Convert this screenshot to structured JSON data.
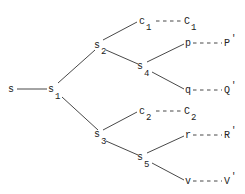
{
  "diagram": {
    "type": "tree",
    "nodes": [
      {
        "id": "s",
        "base": "s",
        "sub": "",
        "x": 8,
        "y": 92
      },
      {
        "id": "s1",
        "base": "s",
        "sub": "1",
        "x": 50,
        "y": 92
      },
      {
        "id": "s2",
        "base": "s",
        "sub": "2",
        "x": 96,
        "y": 48
      },
      {
        "id": "s3",
        "base": "s",
        "sub": "3",
        "x": 96,
        "y": 137
      },
      {
        "id": "c1",
        "base": "c",
        "sub": "1",
        "x": 140,
        "y": 24
      },
      {
        "id": "s4",
        "base": "s",
        "sub": "4",
        "x": 139,
        "y": 69
      },
      {
        "id": "c2",
        "base": "c",
        "sub": "2",
        "x": 140,
        "y": 114
      },
      {
        "id": "s5",
        "base": "s",
        "sub": "5",
        "x": 139,
        "y": 160
      },
      {
        "id": "p",
        "base": "p",
        "sub": "",
        "x": 185,
        "y": 46
      },
      {
        "id": "q",
        "base": "q",
        "sub": "",
        "x": 185,
        "y": 93
      },
      {
        "id": "r",
        "base": "r",
        "sub": "",
        "x": 185,
        "y": 138
      },
      {
        "id": "v",
        "base": "v",
        "sub": "",
        "x": 185,
        "y": 184
      },
      {
        "id": "C1",
        "base": "C",
        "sub": "1",
        "x": 184,
        "y": 24
      },
      {
        "id": "P'",
        "base": "P'",
        "sub": "",
        "x": 224,
        "y": 46
      },
      {
        "id": "Q'",
        "base": "Q'",
        "sub": "",
        "x": 224,
        "y": 93
      },
      {
        "id": "C2",
        "base": "C",
        "sub": "2",
        "x": 184,
        "y": 114
      },
      {
        "id": "R'",
        "base": "R'",
        "sub": "",
        "x": 224,
        "y": 138
      },
      {
        "id": "V'",
        "base": "V'",
        "sub": "",
        "x": 224,
        "y": 184
      }
    ],
    "solid_edges": [
      [
        "s",
        "s1"
      ],
      [
        "s1",
        "s2"
      ],
      [
        "s1",
        "s3"
      ],
      [
        "s2",
        "c1"
      ],
      [
        "s2",
        "s4"
      ],
      [
        "s4",
        "p"
      ],
      [
        "s4",
        "q"
      ],
      [
        "s3",
        "c2"
      ],
      [
        "s3",
        "s5"
      ],
      [
        "s5",
        "r"
      ],
      [
        "s5",
        "v"
      ]
    ],
    "dashed_edges": [
      [
        "c1",
        "C1"
      ],
      [
        "p",
        "P'"
      ],
      [
        "q",
        "Q'"
      ],
      [
        "c2",
        "C2"
      ],
      [
        "r",
        "R'"
      ],
      [
        "v",
        "V'"
      ]
    ]
  },
  "labels": {
    "s": "s",
    "s1": "s",
    "s1_sub": "1",
    "s2": "s",
    "s2_sub": "2",
    "s3": "s",
    "s3_sub": "3",
    "s4": "s",
    "s4_sub": "4",
    "s5": "s",
    "s5_sub": "5",
    "c1": "c",
    "c1_sub": "1",
    "c2": "c",
    "c2_sub": "2",
    "C1": "C",
    "C1_sub": "1",
    "C2": "C",
    "C2_sub": "2",
    "p": "p",
    "q": "q",
    "r": "r",
    "v": "v",
    "Pp": "P",
    "Qp": "Q",
    "Rp": "R",
    "Vp": "V",
    "prime": "'"
  }
}
